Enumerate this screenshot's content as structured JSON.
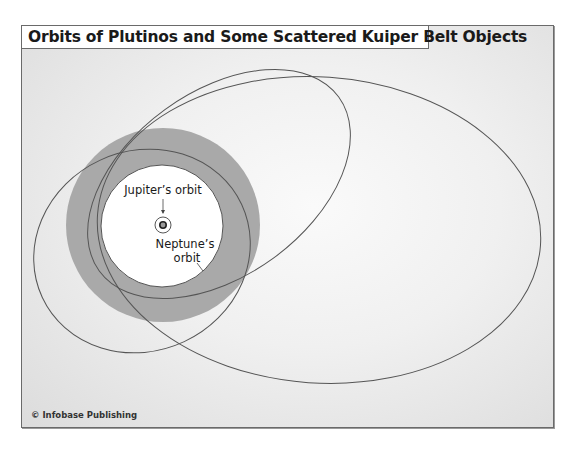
{
  "title": "Orbits of Plutinos and Some Scattered Kuiper Belt Objects",
  "labels": {
    "jupiter": "Jupiter’s orbit",
    "neptune_line1": "Neptune’s",
    "neptune_line2": "orbit"
  },
  "credit": "© Infobase Publishing",
  "colors": {
    "frame_border": "#6a6a6a",
    "kuiper_belt": "#a9a9a9",
    "inner_region": "#ffffff",
    "orbit_line": "#555555",
    "background": "#ececec"
  },
  "elements": {
    "sun": "sun-icon",
    "kuiper_belt": "Kuiper belt annulus",
    "orbits": [
      "Neptune's orbit",
      "Jupiter's orbit",
      "Large scattered object orbit",
      "Medium plutino orbit",
      "Small tilted orbit"
    ]
  }
}
